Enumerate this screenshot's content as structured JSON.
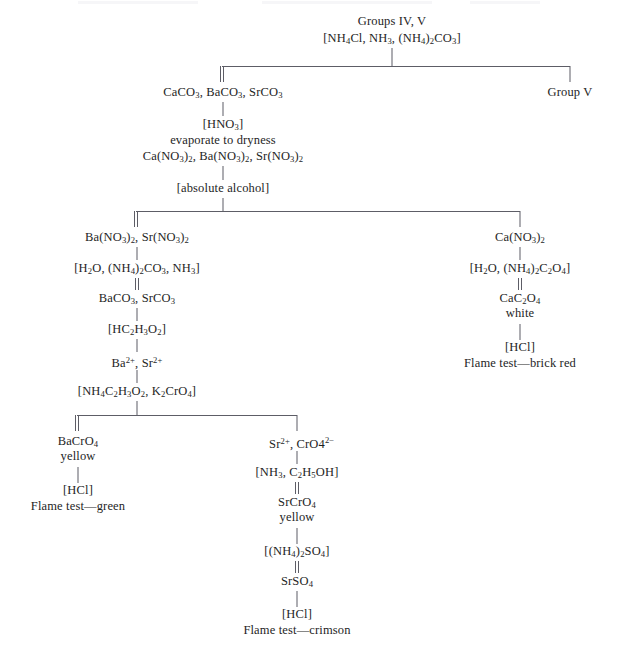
{
  "diagram": {
    "type": "flowchart",
    "line_color": "#5d5d66",
    "text_color": "#1e1e1e",
    "background": "#ffffff",
    "nodes": {
      "root_label": "Groups IV, V",
      "root_reagent": "[NH4Cl, NH3, (NH4)2CO3]",
      "ppt_group4": "CaCO3, BaCO3, SrCO3",
      "group5": "Group V",
      "hno3": "[HNO3]",
      "evaporate": "evaporate to dryness",
      "nitrates": "Ca(NO3)2, Ba(NO3)2, Sr(NO3)2",
      "abs_alcohol": "[absolute alcohol]",
      "ba_sr_nitrate": "Ba(NO3)2, Sr(NO3)2",
      "ca_nitrate": "Ca(NO3)2",
      "water_carbonate_ammonia": "[H2O, (NH4)2CO3, NH3]",
      "water_oxalate": "[H2O, (NH4)2C2O4]",
      "ba_sr_carbonate": "BaCO3, SrCO3",
      "calcium_oxalate": "CaC2O4",
      "calcium_oxalate_color": "white",
      "acetic_acid": "[HC2H3O2]",
      "ba_sr_ions": "Ba2+, Sr2+",
      "hcl_ca": "[HCl]",
      "flame_ca": "Flame test—brick red",
      "ammonium_acetate_chromate": "[NH4C2H3O2, K2CrO4]",
      "barium_chromate": "BaCrO4",
      "barium_chromate_color": "yellow",
      "sr_chromate_ions": "Sr2+, CrO42-",
      "hcl_ba": "[HCl]",
      "flame_ba": "Flame test—green",
      "ammonia_ethanol": "[NH3, C2H5OH]",
      "strontium_chromate": "SrCrO4",
      "strontium_chromate_color": "yellow",
      "ammonium_sulfate": "[(NH4)2SO4]",
      "strontium_sulfate": "SrSO4",
      "hcl_sr": "[HCl]",
      "flame_sr": "Flame test—crimson"
    },
    "legend": {
      "double_line_meaning": "precipitate",
      "single_line_meaning": "solution"
    }
  }
}
